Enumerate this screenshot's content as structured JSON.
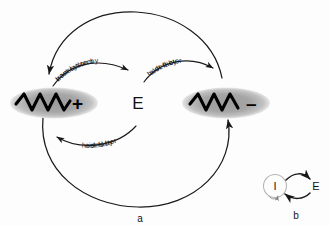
{
  "figure": {
    "panels": [
      {
        "id": "a",
        "label": "a"
      },
      {
        "id": "b",
        "label": "b"
      }
    ]
  },
  "main_panel": {
    "label": "a",
    "center_node": {
      "name": "E",
      "label": "E"
    },
    "left_species": {
      "name": "plus-strand-rna",
      "sign": "+",
      "shape": "wave-in-ellipse"
    },
    "right_species": {
      "name": "minus-strand-rna",
      "sign": "–",
      "shape": "wave-in-ellipse"
    },
    "arrows": [
      {
        "id": "plus-to-E",
        "label_line1": "translation by",
        "label_line2": "host system",
        "from": "+",
        "to": "E"
      },
      {
        "id": "E-to-minus",
        "label_line1": "aided by",
        "label_line2": "host factor",
        "from": "E",
        "to": "–"
      },
      {
        "id": "E-to-plus",
        "label_line1": "aided by",
        "label_line2": "host factor",
        "from": "E",
        "to": "+"
      },
      {
        "id": "minus-to-plus-outer",
        "label_line1": "",
        "label_line2": "",
        "from": "–",
        "to": "+"
      },
      {
        "id": "plus-to-minus-outer",
        "label_line1": "",
        "label_line2": "",
        "from": "+",
        "to": "–"
      }
    ]
  },
  "inset_panel": {
    "label": "b",
    "node_left": {
      "name": "I",
      "label": "I"
    },
    "node_right": {
      "name": "E",
      "label": "E"
    },
    "arrows": [
      {
        "id": "I-to-E-top",
        "from": "I",
        "to": "E"
      },
      {
        "id": "E-to-I-bottom",
        "from": "E",
        "to": "I"
      },
      {
        "id": "I-self-loop",
        "from": "I",
        "to": "I"
      }
    ]
  },
  "colors": {
    "ink": "#17171a",
    "stroke": "#1a1a1d",
    "ellipse_fill": "#a8a8a8",
    "ellipse_fill_edge": "#cccccc",
    "inset_circle_stroke": "#b4b4b4",
    "background": "#fdfdfd"
  }
}
